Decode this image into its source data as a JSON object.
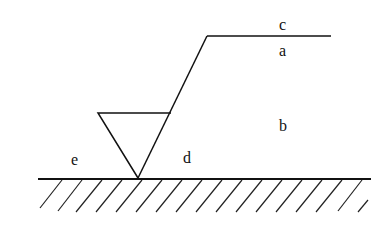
{
  "diagram": {
    "type": "slope-cross-section",
    "labels": {
      "c": "c",
      "a": "a",
      "b": "b",
      "d": "d",
      "e": "e"
    },
    "colors": {
      "line": "#111111",
      "background": "#ffffff"
    }
  }
}
